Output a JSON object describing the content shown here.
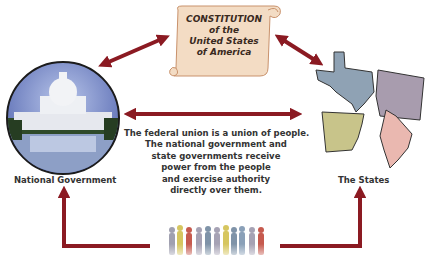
{
  "diagram": {
    "constitution": {
      "lines": [
        "CONSTITUTION",
        "of the",
        "United States",
        "of America"
      ]
    },
    "national_government": {
      "label": "National Government",
      "image": "us-capitol-building"
    },
    "the_states": {
      "label": "The States",
      "shapes": [
        "texas",
        "washington",
        "arkansas",
        "maine"
      ]
    },
    "people": {
      "image": "crowd-silhouettes"
    },
    "center_text": {
      "lines": [
        "The federal union is a union of people.",
        "The national government and",
        "state governments receive",
        "power from the people",
        "and exercise authority",
        "directly over them."
      ]
    },
    "colors": {
      "arrow": "#8b1a22",
      "scroll": "#f3dcc4",
      "scroll_border": "#c9926c",
      "texas": "#8fa2b4",
      "washington": "#a89cae",
      "arkansas": "#c8c48a",
      "maine": "#eab8b0"
    },
    "arrows": [
      {
        "from": "national_government",
        "to": "constitution",
        "type": "double"
      },
      {
        "from": "constitution",
        "to": "the_states",
        "type": "double"
      },
      {
        "from": "national_government",
        "to": "the_states",
        "type": "double"
      },
      {
        "from": "people",
        "to": "national_government",
        "type": "single"
      },
      {
        "from": "people",
        "to": "the_states",
        "type": "single"
      }
    ]
  }
}
